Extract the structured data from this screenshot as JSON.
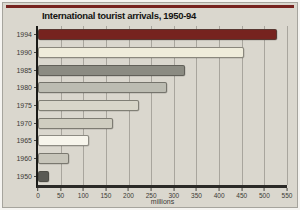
{
  "chart_data": {
    "type": "bar",
    "orientation": "horizontal",
    "title": "International tourist arrivals, 1950-94",
    "categories": [
      "1994",
      "1990",
      "1985",
      "1980",
      "1975",
      "1970",
      "1965",
      "1960",
      "1950"
    ],
    "values": [
      528,
      455,
      325,
      285,
      222,
      166,
      113,
      69,
      25
    ],
    "xlabel": "millions",
    "xlim": [
      0,
      550
    ],
    "xticks": [
      0,
      50,
      100,
      150,
      200,
      250,
      300,
      350,
      400,
      450,
      500,
      550
    ],
    "grid": "vertical",
    "legend": "none",
    "bar_colors": [
      "#76231f",
      "#efecdb",
      "#8b8b82",
      "#bcbcb2",
      "#d8d6c9",
      "#cfcdc0",
      "#f7f5ec",
      "#c7c5ba",
      "#5a5a54"
    ],
    "colors": {
      "accent_red": "#76231f",
      "panel_bg": "#dad7ce",
      "gridline": "#a8a59d",
      "axis": "#2b2a27"
    }
  }
}
